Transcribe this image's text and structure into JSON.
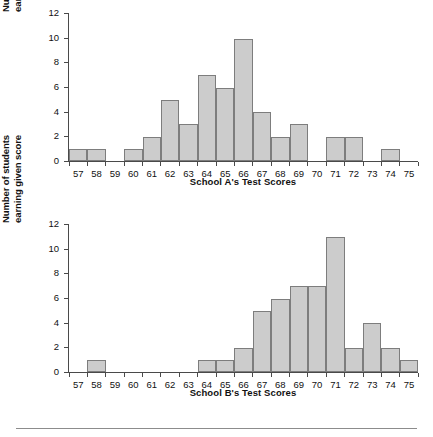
{
  "chart_data": [
    {
      "type": "bar",
      "id": "school-a",
      "title": "",
      "xlabel": "School A's Test Scores",
      "ylabel": "Number of students earning given score",
      "ylabel_lines": [
        "Number of students",
        "earning given score"
      ],
      "categories": [
        57,
        58,
        59,
        60,
        61,
        62,
        63,
        64,
        65,
        66,
        67,
        68,
        69,
        70,
        71,
        72,
        73,
        74,
        75
      ],
      "values": [
        1,
        1,
        0,
        1,
        2,
        5,
        3,
        7,
        6,
        10,
        4,
        2,
        3,
        0,
        2,
        2,
        0,
        1,
        0
      ],
      "ylim": [
        0,
        12
      ],
      "yticks": [
        0,
        2,
        4,
        6,
        8,
        10,
        12
      ],
      "grid": false,
      "legend": "none",
      "bar_fill": "#cccccc",
      "bar_stroke": "#7d7d7d"
    },
    {
      "type": "bar",
      "id": "school-b",
      "title": "",
      "xlabel": "School B's Test Scores",
      "ylabel": "Number of students earning given score",
      "ylabel_lines": [
        "Number of students",
        "earning given score"
      ],
      "categories": [
        57,
        58,
        59,
        60,
        61,
        62,
        63,
        64,
        65,
        66,
        67,
        68,
        69,
        70,
        71,
        72,
        73,
        74,
        75
      ],
      "values": [
        0,
        1,
        0,
        0,
        0,
        0,
        0,
        1,
        1,
        2,
        5,
        6,
        7,
        7,
        11,
        2,
        4,
        2,
        1
      ],
      "ylim": [
        0,
        12
      ],
      "yticks": [
        0,
        2,
        4,
        6,
        8,
        10,
        12
      ],
      "grid": false,
      "legend": "none",
      "bar_fill": "#cccccc",
      "bar_stroke": "#7d7d7d"
    }
  ]
}
